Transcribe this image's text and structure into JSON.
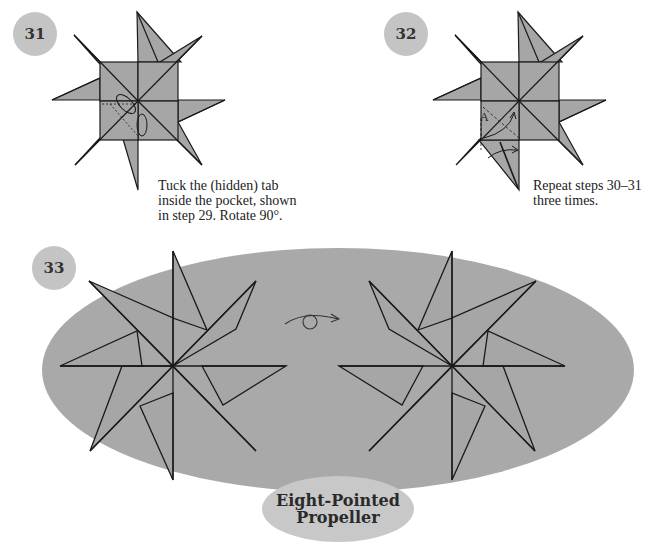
{
  "steps": [
    {
      "number": "31",
      "caption_lines": [
        "Tuck the (hidden) tab",
        "inside the pocket, shown",
        "in step 29. Rotate 90°."
      ]
    },
    {
      "number": "32",
      "caption_lines": [
        "Repeat steps 30–31",
        "three times."
      ],
      "fold_label": "A"
    },
    {
      "number": "33"
    }
  ],
  "title": {
    "line1": "Eight-Pointed",
    "line2": "Propeller"
  },
  "icons": {
    "turn_over": "turn-over-arrow-icon"
  },
  "colors": {
    "paper": "#a6a6a6",
    "ellipse": "#a9a9a9",
    "badge": "#c4c4c4",
    "line": "#1a1a1a"
  }
}
